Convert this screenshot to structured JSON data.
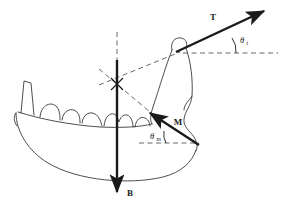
{
  "figure": {
    "kind": "free-body-diagram",
    "background_color": "#ffffff",
    "outline_color": "#3a3a3a",
    "vector_color": "#1a1a1a",
    "dashed_color": "#555555"
  },
  "vectors": [
    {
      "id": "tension",
      "label": "T",
      "label_x": 213,
      "label_y": 20,
      "tail_x": 176,
      "tail_y": 52,
      "tip_x": 268,
      "tip_y": 9,
      "angle_label": "θ",
      "angle_subscript": "t",
      "angle_label_x": 240,
      "angle_label_y": 42,
      "angle_sub_x": 247,
      "angle_sub_y": 44
    },
    {
      "id": "muscle",
      "label": "M",
      "label_x": 178,
      "label_y": 124,
      "tail_x": 199,
      "tail_y": 145,
      "tip_x": 146,
      "tip_y": 110,
      "angle_label": "θ",
      "angle_subscript": "m",
      "angle_label_x": 152,
      "angle_label_y": 138,
      "angle_sub_x": 159,
      "angle_sub_y": 140
    },
    {
      "id": "bite",
      "label": "B",
      "label_x": 126,
      "label_y": 195,
      "tail_x": 117,
      "tail_y": 60,
      "tip_x": 117,
      "tip_y": 196,
      "angle_label": "",
      "angle_subscript": "",
      "angle_label_x": 0,
      "angle_label_y": 0,
      "angle_sub_x": 0,
      "angle_sub_y": 0
    }
  ],
  "reference_lines": [
    {
      "id": "t-horizontal-dashed",
      "x1": 183,
      "y1": 53,
      "x2": 278,
      "y2": 53
    },
    {
      "id": "m-horizontal-dashed",
      "x1": 139,
      "y1": 143,
      "x2": 199,
      "y2": 143
    },
    {
      "id": "pivot-vertical-dashed",
      "x1": 117,
      "y1": 32,
      "x2": 117,
      "y2": 112
    },
    {
      "id": "pivot-to-condyle-dashed",
      "x1": 100,
      "y1": 84,
      "x2": 180,
      "y2": 52
    },
    {
      "id": "pivot-to-muscle-dashed",
      "x1": 100,
      "y1": 70,
      "x2": 150,
      "y2": 112
    }
  ],
  "pivot": {
    "id": "instant-center",
    "x": 117,
    "y": 84
  }
}
